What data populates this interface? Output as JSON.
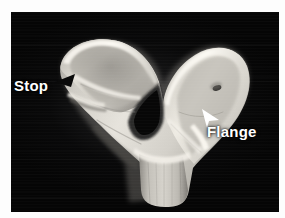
{
  "figure": {
    "kind": "grayscale-photograph",
    "background_color": "#050505",
    "page_color": "#fdfdfd",
    "specimen_color": "#d8d6d0",
    "annotation_text_color": "#ffffff"
  },
  "annotations": [
    {
      "id": "stop",
      "label": "Stop",
      "arrow_icon": "arrowhead-left-black",
      "arrow_color": "#0a0a0a",
      "points_to": "ridge on left superior wing"
    },
    {
      "id": "flange",
      "label": "Flange",
      "arrow_icon": "arrowhead-upleft-white",
      "arrow_color": "#ffffff",
      "points_to": "lateral flange on right inferior border"
    }
  ]
}
